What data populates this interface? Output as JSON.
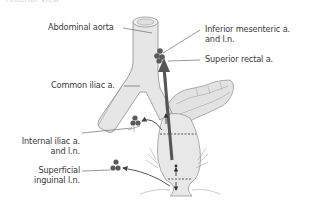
{
  "figure": {
    "cut_caption": "Anterior view",
    "labels": {
      "abdominal_aorta": "Abdominal aorta",
      "inferior_mesenteric_line1": "Inferior mesenteric a.",
      "inferior_mesenteric_line2": "and l.n.",
      "superior_rectal": "Superior rectal a.",
      "common_iliac": "Common iliac a.",
      "internal_iliac_line1": "Internal iliac a.",
      "internal_iliac_line2": "and l.n.",
      "superficial_inguinal_line1": "Superficial",
      "superficial_inguinal_line2": "inguinal l.n."
    },
    "colors": {
      "vessel_fill": "#e4e4e4",
      "vessel_stroke": "#8c8c8c",
      "node_fill": "#5a5a5a",
      "arrow": "#555555",
      "label_text": "#3a3a3a",
      "leader_line": "#555555"
    }
  }
}
